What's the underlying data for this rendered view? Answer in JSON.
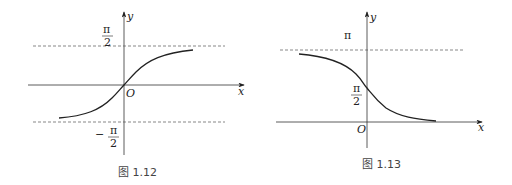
{
  "figures": [
    {
      "caption": "图 1.12",
      "x_label": "x",
      "y_label": "y",
      "origin_label": "O",
      "upper_asymptote": {
        "num": "π",
        "den": "2"
      },
      "lower_asymptote": {
        "sign": "−",
        "num": "π",
        "den": "2"
      },
      "description": "Graph of y = arctan x with horizontal asymptotes y = π/2 and y = −π/2"
    },
    {
      "caption": "图 1.13",
      "x_label": "x",
      "y_label": "y",
      "origin_label": "O",
      "upper_asymptote": {
        "label": "π"
      },
      "intercept": {
        "num": "π",
        "den": "2"
      },
      "description": "Graph of y = arccot x with horizontal asymptotes y = π and y = 0"
    }
  ],
  "colors": {
    "line": "#222222",
    "dashed": "#555555",
    "text": "#222222"
  }
}
